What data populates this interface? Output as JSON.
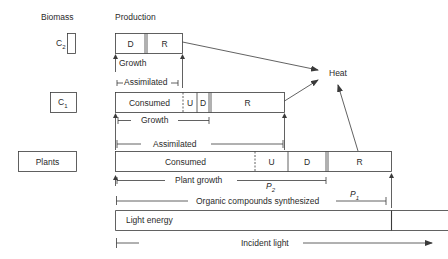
{
  "headers": {
    "biomass": "Biomass",
    "production": "Production"
  },
  "levels": {
    "c2": {
      "label_main": "C",
      "label_sub": "2",
      "segments": [
        {
          "label": "D"
        },
        {
          "label": "R"
        }
      ],
      "growth_label": "Growth",
      "assimilated_label": "Assimilated"
    },
    "c1": {
      "label_main": "C",
      "label_sub": "1",
      "segments": [
        {
          "label": "Consumed"
        },
        {
          "label": "U"
        },
        {
          "label": "D"
        },
        {
          "label": "R"
        }
      ],
      "growth_label": "Growth",
      "assimilated_label": "Assimilated"
    },
    "plants": {
      "label": "Plants",
      "segments": [
        {
          "label": "Consumed"
        },
        {
          "label": "U"
        },
        {
          "label": "D"
        },
        {
          "label": "R"
        }
      ],
      "growth_label": "Plant growth",
      "p2_main": "P",
      "p2_sub": "2",
      "synth_label": "Organic compounds synthesized",
      "p1_main": "P",
      "p1_sub": "1"
    }
  },
  "light": {
    "box_label": "Light energy",
    "incident_label": "Incident light"
  },
  "heat": {
    "label": "Heat"
  },
  "colors": {
    "line": "#3a3a3a",
    "text": "#2a2a2a",
    "background": "#ffffff"
  }
}
